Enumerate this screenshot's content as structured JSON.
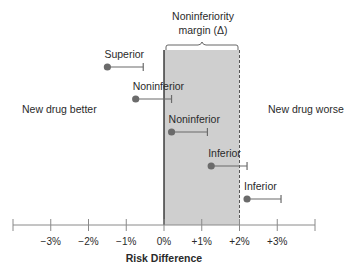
{
  "chart_data": {
    "type": "scatter",
    "subtype": "forest-plot-intervals",
    "title": "",
    "xlabel": "Risk Difference",
    "ylabel": "",
    "xlim": [
      -4,
      4
    ],
    "x_ticks": [
      -4,
      -3,
      -2,
      -1,
      0,
      1,
      2,
      3,
      4
    ],
    "x_tick_labels": [
      "",
      "−3%",
      "−2%",
      "−1%",
      "0%",
      "+1%",
      "+2%",
      "+3%",
      ""
    ],
    "grid": false,
    "legend": null,
    "margin": {
      "label_line1": "Noninferiority",
      "label_line2": "margin (Δ)",
      "start": 0,
      "end": 2,
      "fill_color": "#cfcfcf"
    },
    "region_labels": {
      "left": "New drug better",
      "right": "New drug worse"
    },
    "series": [
      {
        "name": "Superior",
        "point": -1.5,
        "upper": -0.55
      },
      {
        "name": "Noninferior",
        "point": -0.75,
        "upper": 0.2
      },
      {
        "name": "Noninferior",
        "point": 0.2,
        "upper": 1.15
      },
      {
        "name": "Inferior",
        "point": 1.25,
        "upper": 2.2
      },
      {
        "name": "Inferior",
        "point": 2.2,
        "upper": 3.1
      }
    ],
    "colors": {
      "point": "#6b6b6b",
      "whisker": "#6b6b6b",
      "axis": "#8a8a8a",
      "zero_line": "#222222",
      "margin_line": "#555555"
    }
  }
}
